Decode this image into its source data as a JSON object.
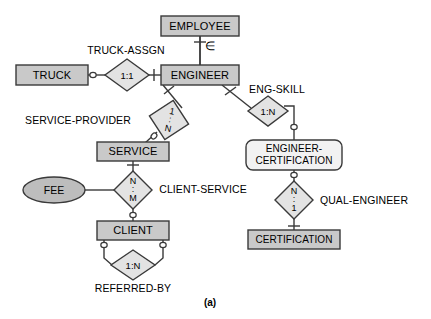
{
  "figure": {
    "caption": "(a)",
    "colors": {
      "entity_fill": "#c9c9c9",
      "weak_entity_fill": "#f2f2f2",
      "relationship_fill": "#e3e3e3",
      "attribute_fill": "#bdbdbd",
      "stroke": "#3a3a3a",
      "text": "#000000",
      "background": "#ffffff"
    }
  },
  "entities": [
    {
      "id": "employee",
      "label": "EMPLOYEE",
      "type": "strong",
      "x": 200,
      "y": 26,
      "w": 78,
      "h": 20
    },
    {
      "id": "truck",
      "label": "TRUCK",
      "type": "strong",
      "x": 52,
      "y": 75,
      "w": 72,
      "h": 20
    },
    {
      "id": "engineer",
      "label": "ENGINEER",
      "type": "strong",
      "x": 200,
      "y": 75,
      "w": 78,
      "h": 20
    },
    {
      "id": "service",
      "label": "SERVICE",
      "type": "strong",
      "x": 133,
      "y": 152,
      "w": 72,
      "h": 19
    },
    {
      "id": "client",
      "label": "CLIENT",
      "type": "strong",
      "x": 133,
      "y": 230,
      "w": 72,
      "h": 19
    },
    {
      "id": "certification",
      "label": "CERTIFICATION",
      "type": "strong",
      "x": 294,
      "y": 239,
      "w": 92,
      "h": 19
    }
  ],
  "weak_entities": [
    {
      "id": "engineer-certification",
      "label_line1": "ENGINEER-",
      "label_line2": "CERTIFICATION",
      "type": "associative",
      "x": 294,
      "y": 155,
      "w": 96,
      "h": 30
    }
  ],
  "relationships": [
    {
      "id": "truck-assgn",
      "name": "TRUCK-ASSGN",
      "cardinality": "1:1",
      "card_style": "inline",
      "x": 127,
      "y": 75,
      "rx": 22,
      "ry": 16,
      "rotated": false,
      "name_x": 126,
      "name_y": 51
    },
    {
      "id": "service-provider",
      "name": "SERVICE-PROVIDER",
      "cardinality": "1:N",
      "card_style": "stacked",
      "x": 169,
      "y": 120,
      "rx": 20,
      "ry": 20,
      "rotated": true,
      "name_x": 78,
      "name_y": 121
    },
    {
      "id": "eng-skill",
      "name": "ENG-SKILL",
      "cardinality": "1:N",
      "card_style": "inline",
      "x": 268,
      "y": 111,
      "rx": 20,
      "ry": 15,
      "rotated": false,
      "name_x": 277,
      "name_y": 90
    },
    {
      "id": "client-service",
      "name": "CLIENT-SERVICE",
      "cardinality": "N:M",
      "card_style": "stacked",
      "x": 133,
      "y": 190,
      "rx": 19,
      "ry": 19,
      "rotated": false,
      "name_x": 203,
      "name_y": 190
    },
    {
      "id": "qual-engineer",
      "name": "QUAL-ENGINEER",
      "cardinality": "N:1",
      "card_style": "stacked",
      "x": 294,
      "y": 200,
      "rx": 19,
      "ry": 19,
      "rotated": false,
      "name_x": 364,
      "name_y": 201
    },
    {
      "id": "referred-by",
      "name": "REFERRED-BY",
      "cardinality": "1:N",
      "card_style": "inline",
      "x": 133,
      "y": 265,
      "rx": 22,
      "ry": 15,
      "rotated": false,
      "name_x": 133,
      "name_y": 289
    }
  ],
  "attributes": [
    {
      "id": "fee",
      "label": "FEE",
      "x": 54,
      "y": 190,
      "rx": 31,
      "ry": 13
    }
  ],
  "cardinality_text": {
    "truck_assgn": "1:1",
    "service_provider_top": "1",
    "service_provider_bottom": "N",
    "eng_skill": "1:N",
    "client_service_top": "N",
    "client_service_bottom": "M",
    "qual_engineer_top": "N",
    "qual_engineer_bottom": "1",
    "referred_by": "1:N",
    "separator": ":"
  },
  "notation": {
    "subset_symbol": "∈",
    "subset_meaning": "subtype-relationship-symbol"
  },
  "connections": [
    {
      "id": "employee-engineer",
      "from": "employee",
      "to": "engineer",
      "style": "thick-vertical",
      "marker_from": "mandatory",
      "marker_to": "none"
    },
    {
      "id": "truck-truckassgn",
      "from": "truck",
      "to": "truck-assgn",
      "style": "horizontal",
      "marker_from": "optional",
      "marker_to": "none"
    },
    {
      "id": "truckassgn-engineer",
      "from": "truck-assgn",
      "to": "engineer",
      "style": "horizontal",
      "marker_from": "none",
      "marker_to": "mandatory"
    },
    {
      "id": "engineer-serviceprovider",
      "from": "engineer",
      "to": "service-provider",
      "style": "diagonal",
      "marker_from": "mandatory",
      "marker_to": "none"
    },
    {
      "id": "serviceprovider-service",
      "from": "service-provider",
      "to": "service",
      "style": "diagonal",
      "marker_from": "none",
      "marker_to": "optional"
    },
    {
      "id": "engineer-engskill",
      "from": "engineer",
      "to": "eng-skill",
      "style": "diagonal",
      "marker_from": "mandatory",
      "marker_to": "none"
    },
    {
      "id": "engskill-engineercertification",
      "from": "eng-skill",
      "to": "engineer-certification",
      "style": "elbow",
      "marker_from": "none",
      "marker_to": "optional"
    },
    {
      "id": "service-clientservice",
      "from": "service",
      "to": "client-service",
      "style": "vertical",
      "marker_from": "mandatory",
      "marker_to": "none"
    },
    {
      "id": "fee-clientservice",
      "from": "fee",
      "to": "client-service",
      "style": "horizontal",
      "marker_from": "none",
      "marker_to": "none"
    },
    {
      "id": "clientservice-client",
      "from": "client-service",
      "to": "client",
      "style": "vertical",
      "marker_from": "none",
      "marker_to": "optional"
    },
    {
      "id": "client-referredby-left",
      "from": "client",
      "to": "referred-by",
      "style": "elbow",
      "marker_from": "optional",
      "marker_to": "none"
    },
    {
      "id": "client-referredby-right",
      "from": "client",
      "to": "referred-by",
      "style": "elbow",
      "marker_from": "optional",
      "marker_to": "none"
    },
    {
      "id": "engineercertification-qual",
      "from": "engineer-certification",
      "to": "qual-engineer",
      "style": "vertical",
      "marker_from": "optional",
      "marker_to": "none"
    },
    {
      "id": "qual-certification",
      "from": "qual-engineer",
      "to": "certification",
      "style": "vertical",
      "marker_from": "none",
      "marker_to": "mandatory"
    }
  ]
}
